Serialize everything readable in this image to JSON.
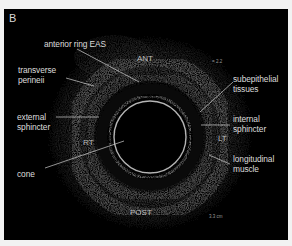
{
  "figure": {
    "panel_letter": "B",
    "orientation": {
      "anterior": "ANT",
      "posterior": "POST",
      "right": "RT",
      "left": "LT"
    },
    "scale_markers": {
      "top_right": "= 2.2",
      "bottom_right": "3.3 cm"
    },
    "annotations": [
      {
        "id": "anterior-ring-eas",
        "text": "anterior ring EAS"
      },
      {
        "id": "transverse-perinei",
        "line1": "transverse",
        "line2": "perineii"
      },
      {
        "id": "external-sphincter",
        "line1": "external",
        "line2": "sphincter"
      },
      {
        "id": "cone",
        "text": "cone"
      },
      {
        "id": "subepithelial-tissues",
        "line1": "subepithelial",
        "line2": "tissues"
      },
      {
        "id": "internal-sphincter",
        "line1": "internal",
        "line2": "sphincter"
      },
      {
        "id": "longitudinal-muscle",
        "line1": "longitudinal",
        "line2": "muscle"
      }
    ],
    "colors": {
      "background": "#000000",
      "label_text": "#dcdcdc",
      "frame": "#f2f2f2"
    }
  }
}
